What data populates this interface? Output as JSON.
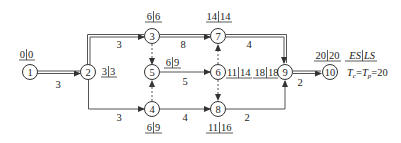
{
  "diagram": {
    "type": "double-code network diagram (activity on arrow)",
    "legend": {
      "label": "ES|LS",
      "es": "ES",
      "ls": "LS"
    },
    "time_note": {
      "tc": "T",
      "tc_sub": "c",
      "tp": "T",
      "tp_sub": "p",
      "value": "=20",
      "text": "Tc=Tp=20"
    },
    "nodes": [
      {
        "id": "1",
        "es": "0",
        "ls": "0"
      },
      {
        "id": "2",
        "es": "3",
        "ls": "3"
      },
      {
        "id": "3",
        "es": "6",
        "ls": "6"
      },
      {
        "id": "4",
        "es": "6",
        "ls": "9"
      },
      {
        "id": "5",
        "es": "6",
        "ls": "9"
      },
      {
        "id": "6",
        "es": "11",
        "ls": "14"
      },
      {
        "id": "7",
        "es": "14",
        "ls": "14"
      },
      {
        "id": "8",
        "es": "11",
        "ls": "16"
      },
      {
        "id": "9",
        "es": "18",
        "ls": "18"
      },
      {
        "id": "10",
        "es": "20",
        "ls": "20"
      }
    ],
    "activities": [
      {
        "from": "1",
        "to": "2",
        "duration": "3",
        "critical": true
      },
      {
        "from": "2",
        "to": "3",
        "duration": "3",
        "critical": true
      },
      {
        "from": "2",
        "to": "4",
        "duration": "3",
        "critical": false
      },
      {
        "from": "3",
        "to": "7",
        "duration": "8",
        "critical": true
      },
      {
        "from": "3",
        "to": "5",
        "duration": "",
        "dummy": true
      },
      {
        "from": "4",
        "to": "5",
        "duration": "",
        "dummy": true
      },
      {
        "from": "5",
        "to": "6",
        "duration": "5",
        "critical": false
      },
      {
        "from": "4",
        "to": "8",
        "duration": "4",
        "critical": false
      },
      {
        "from": "6",
        "to": "7",
        "duration": "",
        "dummy": true
      },
      {
        "from": "6",
        "to": "8",
        "duration": "",
        "dummy": true
      },
      {
        "from": "7",
        "to": "9",
        "duration": "4",
        "critical": true
      },
      {
        "from": "8",
        "to": "9",
        "duration": "2",
        "critical": false
      },
      {
        "from": "9",
        "to": "10",
        "duration": "2",
        "critical": true
      }
    ]
  }
}
